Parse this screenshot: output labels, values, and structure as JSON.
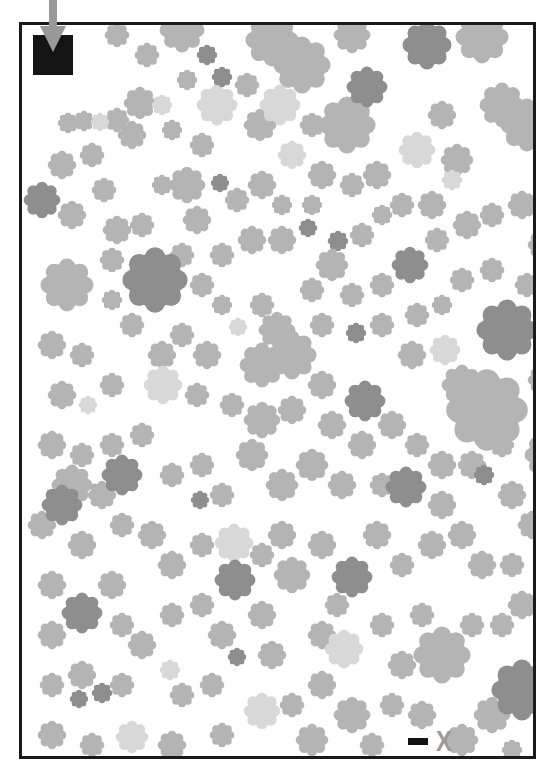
{
  "puzzle": {
    "type": "maze",
    "start_label": "start",
    "end_label": "X",
    "colors": {
      "frame": "#1a1a1a",
      "start_box": "#141414",
      "arrow": "#999999",
      "end_x": "#9a9a9a",
      "blob_medium": "#b4b4b4",
      "blob_light": "#d8d8d8",
      "blob_dark": "#8e8e8e"
    }
  },
  "blobs": [
    {
      "x": 95,
      "y": 10,
      "r": 12,
      "c": "m"
    },
    {
      "x": 125,
      "y": 30,
      "r": 12,
      "c": "m"
    },
    {
      "x": 160,
      "y": 5,
      "r": 22,
      "c": "m"
    },
    {
      "x": 185,
      "y": 30,
      "r": 10,
      "c": "d"
    },
    {
      "x": 200,
      "y": 52,
      "r": 10,
      "c": "d"
    },
    {
      "x": 195,
      "y": 80,
      "r": 20,
      "c": "l"
    },
    {
      "x": 165,
      "y": 55,
      "r": 10,
      "c": "m"
    },
    {
      "x": 250,
      "y": 15,
      "r": 26,
      "c": "m"
    },
    {
      "x": 280,
      "y": 40,
      "r": 28,
      "c": "m"
    },
    {
      "x": 258,
      "y": 80,
      "r": 20,
      "c": "l"
    },
    {
      "x": 225,
      "y": 60,
      "r": 12,
      "c": "m"
    },
    {
      "x": 238,
      "y": 100,
      "r": 16,
      "c": "m"
    },
    {
      "x": 290,
      "y": 100,
      "r": 12,
      "c": "m"
    },
    {
      "x": 270,
      "y": 130,
      "r": 14,
      "c": "l"
    },
    {
      "x": 330,
      "y": 10,
      "r": 18,
      "c": "m"
    },
    {
      "x": 345,
      "y": 62,
      "r": 20,
      "c": "d"
    },
    {
      "x": 325,
      "y": 100,
      "r": 28,
      "c": "m"
    },
    {
      "x": 395,
      "y": 125,
      "r": 18,
      "c": "l"
    },
    {
      "x": 405,
      "y": 20,
      "r": 24,
      "c": "d"
    },
    {
      "x": 460,
      "y": 12,
      "r": 26,
      "c": "m"
    },
    {
      "x": 480,
      "y": 80,
      "r": 22,
      "c": "m"
    },
    {
      "x": 505,
      "y": 100,
      "r": 26,
      "c": "m"
    },
    {
      "x": 420,
      "y": 90,
      "r": 14,
      "c": "m"
    },
    {
      "x": 435,
      "y": 135,
      "r": 16,
      "c": "m"
    },
    {
      "x": 410,
      "y": 180,
      "r": 14,
      "c": "m"
    },
    {
      "x": 430,
      "y": 155,
      "r": 10,
      "c": "l"
    },
    {
      "x": 46,
      "y": 98,
      "r": 10,
      "c": "m"
    },
    {
      "x": 62,
      "y": 96,
      "r": 10,
      "c": "m"
    },
    {
      "x": 78,
      "y": 97,
      "r": 9,
      "c": "l"
    },
    {
      "x": 95,
      "y": 95,
      "r": 12,
      "c": "m"
    },
    {
      "x": 118,
      "y": 78,
      "r": 16,
      "c": "m"
    },
    {
      "x": 140,
      "y": 80,
      "r": 10,
      "c": "l"
    },
    {
      "x": 110,
      "y": 110,
      "r": 14,
      "c": "m"
    },
    {
      "x": 150,
      "y": 105,
      "r": 10,
      "c": "m"
    },
    {
      "x": 180,
      "y": 120,
      "r": 12,
      "c": "m"
    },
    {
      "x": 198,
      "y": 158,
      "r": 9,
      "c": "d"
    },
    {
      "x": 40,
      "y": 140,
      "r": 14,
      "c": "m"
    },
    {
      "x": 70,
      "y": 130,
      "r": 12,
      "c": "m"
    },
    {
      "x": 20,
      "y": 175,
      "r": 18,
      "c": "d"
    },
    {
      "x": 50,
      "y": 190,
      "r": 14,
      "c": "m"
    },
    {
      "x": 82,
      "y": 165,
      "r": 12,
      "c": "m"
    },
    {
      "x": 95,
      "y": 205,
      "r": 14,
      "c": "m"
    },
    {
      "x": 120,
      "y": 200,
      "r": 12,
      "c": "m"
    },
    {
      "x": 165,
      "y": 160,
      "r": 18,
      "c": "m"
    },
    {
      "x": 175,
      "y": 195,
      "r": 14,
      "c": "m"
    },
    {
      "x": 140,
      "y": 160,
      "r": 10,
      "c": "m"
    },
    {
      "x": 215,
      "y": 175,
      "r": 12,
      "c": "m"
    },
    {
      "x": 240,
      "y": 160,
      "r": 14,
      "c": "m"
    },
    {
      "x": 260,
      "y": 180,
      "r": 10,
      "c": "m"
    },
    {
      "x": 300,
      "y": 150,
      "r": 14,
      "c": "m"
    },
    {
      "x": 330,
      "y": 160,
      "r": 12,
      "c": "m"
    },
    {
      "x": 355,
      "y": 150,
      "r": 14,
      "c": "m"
    },
    {
      "x": 380,
      "y": 180,
      "r": 12,
      "c": "m"
    },
    {
      "x": 290,
      "y": 180,
      "r": 10,
      "c": "m"
    },
    {
      "x": 230,
      "y": 215,
      "r": 14,
      "c": "m"
    },
    {
      "x": 260,
      "y": 215,
      "r": 14,
      "c": "m"
    },
    {
      "x": 286,
      "y": 203,
      "r": 9,
      "c": "d"
    },
    {
      "x": 316,
      "y": 216,
      "r": 10,
      "c": "d"
    },
    {
      "x": 200,
      "y": 230,
      "r": 12,
      "c": "m"
    },
    {
      "x": 340,
      "y": 210,
      "r": 12,
      "c": "m"
    },
    {
      "x": 360,
      "y": 190,
      "r": 10,
      "c": "m"
    },
    {
      "x": 388,
      "y": 240,
      "r": 18,
      "c": "d"
    },
    {
      "x": 310,
      "y": 240,
      "r": 16,
      "c": "m"
    },
    {
      "x": 330,
      "y": 270,
      "r": 12,
      "c": "m"
    },
    {
      "x": 290,
      "y": 265,
      "r": 12,
      "c": "m"
    },
    {
      "x": 360,
      "y": 260,
      "r": 12,
      "c": "m"
    },
    {
      "x": 415,
      "y": 215,
      "r": 12,
      "c": "m"
    },
    {
      "x": 445,
      "y": 200,
      "r": 14,
      "c": "m"
    },
    {
      "x": 470,
      "y": 190,
      "r": 12,
      "c": "m"
    },
    {
      "x": 500,
      "y": 180,
      "r": 14,
      "c": "m"
    },
    {
      "x": 520,
      "y": 220,
      "r": 14,
      "c": "m"
    },
    {
      "x": 505,
      "y": 260,
      "r": 12,
      "c": "m"
    },
    {
      "x": 470,
      "y": 245,
      "r": 12,
      "c": "m"
    },
    {
      "x": 440,
      "y": 255,
      "r": 12,
      "c": "m"
    },
    {
      "x": 485,
      "y": 305,
      "r": 30,
      "c": "d"
    },
    {
      "x": 45,
      "y": 260,
      "r": 26,
      "c": "m"
    },
    {
      "x": 133,
      "y": 255,
      "r": 32,
      "c": "d"
    },
    {
      "x": 90,
      "y": 235,
      "r": 12,
      "c": "m"
    },
    {
      "x": 90,
      "y": 275,
      "r": 10,
      "c": "m"
    },
    {
      "x": 110,
      "y": 300,
      "r": 12,
      "c": "m"
    },
    {
      "x": 160,
      "y": 230,
      "r": 12,
      "c": "m"
    },
    {
      "x": 180,
      "y": 260,
      "r": 12,
      "c": "m"
    },
    {
      "x": 200,
      "y": 280,
      "r": 10,
      "c": "m"
    },
    {
      "x": 216,
      "y": 302,
      "r": 9,
      "c": "l"
    },
    {
      "x": 240,
      "y": 280,
      "r": 12,
      "c": "m"
    },
    {
      "x": 255,
      "y": 305,
      "r": 18,
      "c": "m"
    },
    {
      "x": 270,
      "y": 330,
      "r": 24,
      "c": "m"
    },
    {
      "x": 240,
      "y": 340,
      "r": 22,
      "c": "m"
    },
    {
      "x": 300,
      "y": 300,
      "r": 12,
      "c": "m"
    },
    {
      "x": 334,
      "y": 308,
      "r": 10,
      "c": "d"
    },
    {
      "x": 360,
      "y": 300,
      "r": 12,
      "c": "m"
    },
    {
      "x": 395,
      "y": 290,
      "r": 12,
      "c": "m"
    },
    {
      "x": 420,
      "y": 280,
      "r": 10,
      "c": "m"
    },
    {
      "x": 423,
      "y": 325,
      "r": 15,
      "c": "l"
    },
    {
      "x": 390,
      "y": 330,
      "r": 14,
      "c": "m"
    },
    {
      "x": 343,
      "y": 376,
      "r": 20,
      "c": "d"
    },
    {
      "x": 465,
      "y": 385,
      "r": 40,
      "c": "m"
    },
    {
      "x": 440,
      "y": 360,
      "r": 20,
      "c": "m"
    },
    {
      "x": 520,
      "y": 355,
      "r": 14,
      "c": "m"
    },
    {
      "x": 525,
      "y": 430,
      "r": 22,
      "c": "m"
    },
    {
      "x": 30,
      "y": 320,
      "r": 14,
      "c": "m"
    },
    {
      "x": 60,
      "y": 330,
      "r": 12,
      "c": "m"
    },
    {
      "x": 40,
      "y": 370,
      "r": 14,
      "c": "m"
    },
    {
      "x": 66,
      "y": 380,
      "r": 9,
      "c": "l"
    },
    {
      "x": 90,
      "y": 360,
      "r": 12,
      "c": "m"
    },
    {
      "x": 140,
      "y": 330,
      "r": 14,
      "c": "m"
    },
    {
      "x": 160,
      "y": 310,
      "r": 12,
      "c": "m"
    },
    {
      "x": 185,
      "y": 330,
      "r": 14,
      "c": "m"
    },
    {
      "x": 141,
      "y": 360,
      "r": 19,
      "c": "l"
    },
    {
      "x": 175,
      "y": 370,
      "r": 12,
      "c": "m"
    },
    {
      "x": 210,
      "y": 380,
      "r": 12,
      "c": "m"
    },
    {
      "x": 240,
      "y": 395,
      "r": 18,
      "c": "m"
    },
    {
      "x": 270,
      "y": 385,
      "r": 14,
      "c": "m"
    },
    {
      "x": 300,
      "y": 360,
      "r": 14,
      "c": "m"
    },
    {
      "x": 310,
      "y": 400,
      "r": 14,
      "c": "m"
    },
    {
      "x": 340,
      "y": 420,
      "r": 14,
      "c": "m"
    },
    {
      "x": 370,
      "y": 400,
      "r": 14,
      "c": "m"
    },
    {
      "x": 395,
      "y": 420,
      "r": 12,
      "c": "m"
    },
    {
      "x": 420,
      "y": 440,
      "r": 14,
      "c": "m"
    },
    {
      "x": 450,
      "y": 440,
      "r": 14,
      "c": "m"
    },
    {
      "x": 480,
      "y": 420,
      "r": 12,
      "c": "m"
    },
    {
      "x": 30,
      "y": 420,
      "r": 14,
      "c": "m"
    },
    {
      "x": 60,
      "y": 430,
      "r": 12,
      "c": "m"
    },
    {
      "x": 90,
      "y": 420,
      "r": 12,
      "c": "m"
    },
    {
      "x": 120,
      "y": 410,
      "r": 12,
      "c": "m"
    },
    {
      "x": 100,
      "y": 450,
      "r": 20,
      "c": "d"
    },
    {
      "x": 150,
      "y": 450,
      "r": 12,
      "c": "m"
    },
    {
      "x": 180,
      "y": 440,
      "r": 12,
      "c": "m"
    },
    {
      "x": 200,
      "y": 470,
      "r": 12,
      "c": "m"
    },
    {
      "x": 178,
      "y": 475,
      "r": 9,
      "c": "d"
    },
    {
      "x": 230,
      "y": 430,
      "r": 16,
      "c": "m"
    },
    {
      "x": 260,
      "y": 460,
      "r": 16,
      "c": "m"
    },
    {
      "x": 290,
      "y": 440,
      "r": 16,
      "c": "m"
    },
    {
      "x": 320,
      "y": 460,
      "r": 14,
      "c": "m"
    },
    {
      "x": 360,
      "y": 460,
      "r": 12,
      "c": "m"
    },
    {
      "x": 384,
      "y": 462,
      "r": 20,
      "c": "d"
    },
    {
      "x": 420,
      "y": 480,
      "r": 14,
      "c": "m"
    },
    {
      "x": 462,
      "y": 450,
      "r": 10,
      "c": "d"
    },
    {
      "x": 490,
      "y": 470,
      "r": 14,
      "c": "m"
    },
    {
      "x": 510,
      "y": 500,
      "r": 14,
      "c": "m"
    },
    {
      "x": 40,
      "y": 480,
      "r": 20,
      "c": "d"
    },
    {
      "x": 50,
      "y": 460,
      "r": 20,
      "c": "m"
    },
    {
      "x": 80,
      "y": 470,
      "r": 14,
      "c": "m"
    },
    {
      "x": 20,
      "y": 500,
      "r": 14,
      "c": "m"
    },
    {
      "x": 60,
      "y": 520,
      "r": 14,
      "c": "m"
    },
    {
      "x": 100,
      "y": 500,
      "r": 12,
      "c": "m"
    },
    {
      "x": 130,
      "y": 510,
      "r": 14,
      "c": "m"
    },
    {
      "x": 150,
      "y": 540,
      "r": 14,
      "c": "m"
    },
    {
      "x": 180,
      "y": 520,
      "r": 12,
      "c": "m"
    },
    {
      "x": 212,
      "y": 518,
      "r": 19,
      "c": "l"
    },
    {
      "x": 213,
      "y": 555,
      "r": 20,
      "c": "d"
    },
    {
      "x": 240,
      "y": 530,
      "r": 12,
      "c": "m"
    },
    {
      "x": 260,
      "y": 510,
      "r": 14,
      "c": "m"
    },
    {
      "x": 270,
      "y": 550,
      "r": 18,
      "c": "m"
    },
    {
      "x": 300,
      "y": 520,
      "r": 14,
      "c": "m"
    },
    {
      "x": 330,
      "y": 552,
      "r": 20,
      "c": "d"
    },
    {
      "x": 315,
      "y": 580,
      "r": 12,
      "c": "m"
    },
    {
      "x": 355,
      "y": 510,
      "r": 14,
      "c": "m"
    },
    {
      "x": 380,
      "y": 540,
      "r": 12,
      "c": "m"
    },
    {
      "x": 410,
      "y": 520,
      "r": 14,
      "c": "m"
    },
    {
      "x": 440,
      "y": 510,
      "r": 14,
      "c": "m"
    },
    {
      "x": 460,
      "y": 540,
      "r": 14,
      "c": "m"
    },
    {
      "x": 490,
      "y": 540,
      "r": 12,
      "c": "m"
    },
    {
      "x": 500,
      "y": 580,
      "r": 14,
      "c": "m"
    },
    {
      "x": 480,
      "y": 600,
      "r": 12,
      "c": "m"
    },
    {
      "x": 30,
      "y": 560,
      "r": 14,
      "c": "m"
    },
    {
      "x": 60,
      "y": 588,
      "r": 20,
      "c": "d"
    },
    {
      "x": 30,
      "y": 610,
      "r": 14,
      "c": "m"
    },
    {
      "x": 90,
      "y": 560,
      "r": 14,
      "c": "m"
    },
    {
      "x": 100,
      "y": 600,
      "r": 12,
      "c": "m"
    },
    {
      "x": 120,
      "y": 620,
      "r": 14,
      "c": "m"
    },
    {
      "x": 150,
      "y": 590,
      "r": 12,
      "c": "m"
    },
    {
      "x": 180,
      "y": 580,
      "r": 12,
      "c": "m"
    },
    {
      "x": 200,
      "y": 610,
      "r": 14,
      "c": "m"
    },
    {
      "x": 240,
      "y": 590,
      "r": 14,
      "c": "m"
    },
    {
      "x": 250,
      "y": 630,
      "r": 14,
      "c": "m"
    },
    {
      "x": 300,
      "y": 610,
      "r": 14,
      "c": "m"
    },
    {
      "x": 322,
      "y": 624,
      "r": 19,
      "c": "l"
    },
    {
      "x": 360,
      "y": 600,
      "r": 12,
      "c": "m"
    },
    {
      "x": 400,
      "y": 590,
      "r": 12,
      "c": "m"
    },
    {
      "x": 420,
      "y": 630,
      "r": 28,
      "c": "m"
    },
    {
      "x": 380,
      "y": 640,
      "r": 14,
      "c": "m"
    },
    {
      "x": 450,
      "y": 600,
      "r": 12,
      "c": "m"
    },
    {
      "x": 500,
      "y": 665,
      "r": 30,
      "c": "d"
    },
    {
      "x": 470,
      "y": 690,
      "r": 18,
      "c": "m"
    },
    {
      "x": 30,
      "y": 660,
      "r": 12,
      "c": "m"
    },
    {
      "x": 60,
      "y": 650,
      "r": 14,
      "c": "m"
    },
    {
      "x": 57,
      "y": 674,
      "r": 9,
      "c": "d"
    },
    {
      "x": 80,
      "y": 668,
      "r": 10,
      "c": "d"
    },
    {
      "x": 100,
      "y": 660,
      "r": 12,
      "c": "m"
    },
    {
      "x": 148,
      "y": 645,
      "r": 10,
      "c": "l"
    },
    {
      "x": 160,
      "y": 670,
      "r": 12,
      "c": "m"
    },
    {
      "x": 190,
      "y": 660,
      "r": 12,
      "c": "m"
    },
    {
      "x": 215,
      "y": 632,
      "r": 9,
      "c": "d"
    },
    {
      "x": 240,
      "y": 686,
      "r": 18,
      "c": "l"
    },
    {
      "x": 270,
      "y": 680,
      "r": 12,
      "c": "m"
    },
    {
      "x": 300,
      "y": 660,
      "r": 14,
      "c": "m"
    },
    {
      "x": 330,
      "y": 690,
      "r": 18,
      "c": "m"
    },
    {
      "x": 370,
      "y": 680,
      "r": 12,
      "c": "m"
    },
    {
      "x": 400,
      "y": 690,
      "r": 14,
      "c": "m"
    },
    {
      "x": 30,
      "y": 710,
      "r": 14,
      "c": "m"
    },
    {
      "x": 70,
      "y": 720,
      "r": 12,
      "c": "m"
    },
    {
      "x": 110,
      "y": 712,
      "r": 16,
      "c": "l"
    },
    {
      "x": 150,
      "y": 720,
      "r": 14,
      "c": "m"
    },
    {
      "x": 200,
      "y": 710,
      "r": 12,
      "c": "m"
    },
    {
      "x": 290,
      "y": 715,
      "r": 16,
      "c": "m"
    },
    {
      "x": 350,
      "y": 720,
      "r": 12,
      "c": "m"
    },
    {
      "x": 440,
      "y": 715,
      "r": 16,
      "c": "m"
    },
    {
      "x": 490,
      "y": 725,
      "r": 10,
      "c": "m"
    }
  ]
}
